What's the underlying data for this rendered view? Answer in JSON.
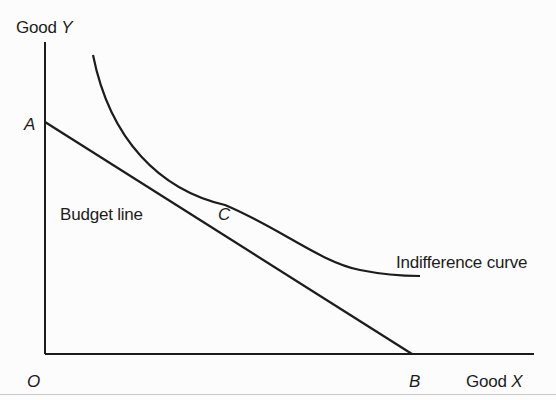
{
  "diagram": {
    "axes": {
      "y_label_prefix": "Good ",
      "y_label_var": "Y",
      "x_label_prefix": "Good ",
      "x_label_var": "X",
      "origin_label": "O"
    },
    "points": {
      "a": "A",
      "b": "B",
      "c": "C"
    },
    "curves": {
      "budget_line_label": "Budget line",
      "indifference_curve_label": "Indifference curve"
    },
    "colors": {
      "ink": "#1c1c1c",
      "paper": "#fcfcfc"
    }
  }
}
